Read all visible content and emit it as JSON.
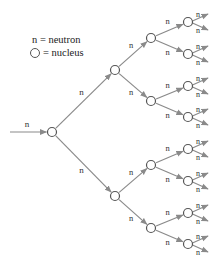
{
  "legend": {
    "neutron_line": "n = neutron",
    "nucleus_line": "= nucleus"
  },
  "diagram": {
    "edge_label": "n",
    "incoming_label": "n",
    "colors": {
      "arrow": "#8a8a8a",
      "node_stroke": "#555555",
      "text": "#333333"
    },
    "levels": [
      {
        "name": "root",
        "nodes": [
          [
            52,
            132
          ]
        ]
      },
      {
        "name": "level1",
        "nodes": [
          [
            115,
            70
          ],
          [
            115,
            196
          ]
        ]
      },
      {
        "name": "level2",
        "nodes": [
          [
            151,
            38
          ],
          [
            151,
            101
          ],
          [
            151,
            165
          ],
          [
            151,
            228
          ]
        ]
      },
      {
        "name": "level3",
        "nodes": [
          [
            188,
            22
          ],
          [
            188,
            54
          ],
          [
            188,
            86
          ],
          [
            188,
            117
          ],
          [
            188,
            149
          ],
          [
            188,
            181
          ],
          [
            188,
            213
          ],
          [
            188,
            244
          ]
        ]
      }
    ]
  }
}
